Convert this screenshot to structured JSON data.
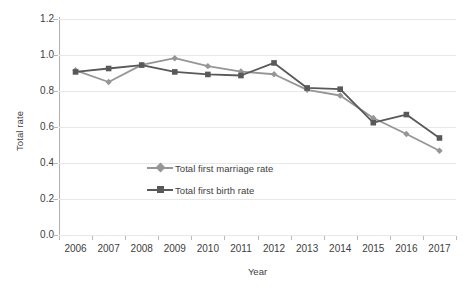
{
  "chart_data": {
    "type": "line",
    "title": "",
    "xlabel": "Year",
    "ylabel": "Total rate",
    "categories": [
      "2006",
      "2007",
      "2008",
      "2009",
      "2010",
      "2011",
      "2012",
      "2013",
      "2014",
      "2015",
      "2016",
      "2017"
    ],
    "x": [
      2006,
      2007,
      2008,
      2009,
      2010,
      2011,
      2012,
      2013,
      2014,
      2015,
      2016,
      2017
    ],
    "ylim": [
      0.0,
      1.2
    ],
    "yticks": [
      "0.0",
      "0.2",
      "0.4",
      "0.6",
      "0.8",
      "1.0",
      "1.2"
    ],
    "ytick_values": [
      0.0,
      0.2,
      0.4,
      0.6,
      0.8,
      1.0,
      1.2
    ],
    "grid": true,
    "legend_position": "inside-center-lower",
    "series": [
      {
        "name": "Total first marriage rate",
        "color": "#969696",
        "marker": "diamond",
        "values": [
          0.915,
          0.85,
          0.945,
          0.982,
          0.938,
          0.908,
          0.893,
          0.806,
          0.775,
          0.65,
          0.561,
          0.468
        ]
      },
      {
        "name": "Total first birth rate",
        "color": "#595959",
        "marker": "square",
        "values": [
          0.906,
          0.925,
          0.944,
          0.906,
          0.892,
          0.886,
          0.956,
          0.817,
          0.81,
          0.624,
          0.669,
          0.539
        ]
      }
    ]
  },
  "axis": {
    "y_title": "Total rate",
    "x_title": "Year"
  },
  "legend": {
    "items": [
      {
        "label": "Total first marriage rate"
      },
      {
        "label": "Total first birth rate"
      }
    ]
  },
  "colors": {
    "marriage": "#969696",
    "birth": "#595959",
    "gridline": "#e8e8e8",
    "axis": "#b0b0b0",
    "text": "#404040",
    "background": "#ffffff"
  }
}
